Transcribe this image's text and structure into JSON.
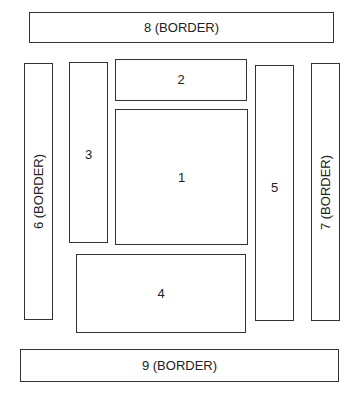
{
  "diagram": {
    "type": "region-layout",
    "boxes": [
      {
        "id": "8",
        "label": "8 (BORDER)",
        "role": "border-top"
      },
      {
        "id": "6",
        "label": "6 (BORDER)",
        "role": "border-left"
      },
      {
        "id": "3",
        "label": "3",
        "role": "region"
      },
      {
        "id": "2",
        "label": "2",
        "role": "region"
      },
      {
        "id": "1",
        "label": "1",
        "role": "center"
      },
      {
        "id": "5",
        "label": "5",
        "role": "region"
      },
      {
        "id": "7",
        "label": "7 (BORDER)",
        "role": "border-right"
      },
      {
        "id": "4",
        "label": "4",
        "role": "region"
      },
      {
        "id": "9",
        "label": "9 (BORDER)",
        "role": "border-bottom"
      }
    ]
  }
}
